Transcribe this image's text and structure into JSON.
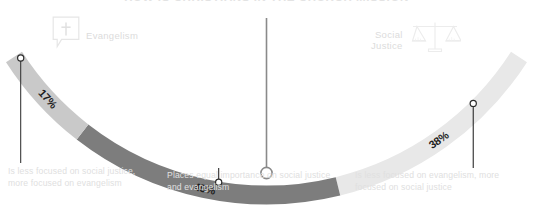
{
  "chart_data": {
    "type": "bar",
    "title": "HOW IS CHRISTIANS IN THE CHURCH MISSION",
    "subtitle": "",
    "xlabel": "",
    "ylabel": "",
    "orientation": "curved-stacked-arc",
    "categories": [
      "Is less focused on social justice, more focused on evangelism",
      "Places equal importance on social justice and evangelism",
      "Is less focused on evangelism, more focused on social justice"
    ],
    "values": [
      17,
      45,
      38
    ],
    "value_labels": [
      "17%",
      "45%",
      "38%"
    ],
    "unit": "%",
    "total": 100,
    "segment_colors": [
      "#c9c9c9",
      "#7d7d7d",
      "#e8e8e8"
    ],
    "axis_poles": [
      "Evangelism",
      "Social Justice"
    ],
    "legend": false,
    "grid": false
  },
  "header": {
    "title": "HOW IS CHRISTIANS IN THE CHURCH MISSION"
  },
  "poles": {
    "left": {
      "label": "Evangelism",
      "icon": "speech-bubble-cross-icon"
    },
    "right": {
      "label": "Social\nJustice",
      "icon": "scales-of-justice-icon"
    }
  },
  "segments": [
    {
      "id": "less-social-justice",
      "percent_label": "17%",
      "percent_value": 17,
      "color": "#c9c9c9",
      "caption": "Is less focused on social justice, more focused on evangelism"
    },
    {
      "id": "equal-importance",
      "percent_label": "45%",
      "percent_value": 45,
      "color": "#7d7d7d",
      "caption": "Places equal importance on social justice and evangelism"
    },
    {
      "id": "less-evangelism",
      "percent_label": "38%",
      "percent_value": 38,
      "color": "#e8e8e8",
      "caption": "Is less focused on evangelism, more focused on social justice"
    }
  ],
  "colors": {
    "segment_light": "#c9c9c9",
    "segment_dark": "#7d7d7d",
    "segment_pale": "#e8e8e8",
    "leader_line": "#3a3a3a",
    "center_leader_line": "#6e6e6e",
    "caption_text": "#e0e0e0",
    "pole_text": "#dcdcdc",
    "background": "#ffffff"
  }
}
